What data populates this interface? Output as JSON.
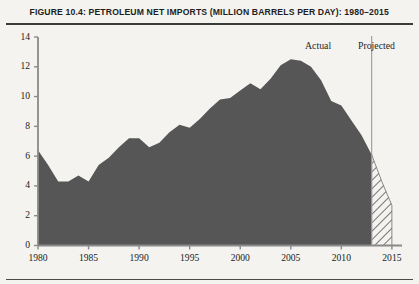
{
  "figure": {
    "title": "FIGURE 10.4: PETROLEUM NET IMPORTS (MILLION BARRELS PER DAY): 1980–2015"
  },
  "annotations": {
    "actual_label": "Actual",
    "projected_label": "Projected",
    "divider_year": 2013
  },
  "axes": {
    "y_ticks": [
      "0",
      "2",
      "4",
      "6",
      "8",
      "10",
      "12",
      "14"
    ],
    "x_ticks": [
      "1980",
      "1985",
      "1990",
      "1995",
      "2000",
      "2005",
      "2010",
      "2015"
    ]
  },
  "colors": {
    "area_fill": "#565656",
    "projected_hatch": "#6a6a6a",
    "axis": "#7d7d7d",
    "background": "#f4f3ef",
    "text": "#1f1f1f"
  },
  "chart_data": {
    "type": "area",
    "title": "FIGURE 10.4: PETROLEUM NET IMPORTS (MILLION BARRELS PER DAY): 1980–2015",
    "xlabel": "",
    "ylabel": "Million barrels per day",
    "xlim": [
      1980,
      2016
    ],
    "ylim": [
      0,
      14
    ],
    "grid": false,
    "legend": false,
    "y_ticks": [
      0,
      2,
      4,
      6,
      8,
      10,
      12,
      14
    ],
    "x_ticks": [
      1980,
      1985,
      1990,
      1995,
      2000,
      2005,
      2010,
      2015
    ],
    "x": [
      1980,
      1981,
      1982,
      1983,
      1984,
      1985,
      1986,
      1987,
      1988,
      1989,
      1990,
      1991,
      1992,
      1993,
      1994,
      1995,
      1996,
      1997,
      1998,
      1999,
      2000,
      2001,
      2002,
      2003,
      2004,
      2005,
      2006,
      2007,
      2008,
      2009,
      2010,
      2011,
      2012,
      2013,
      2014,
      2015
    ],
    "series": [
      {
        "name": "Actual",
        "style": "solid-fill",
        "values": [
          6.4,
          5.4,
          4.3,
          4.3,
          4.7,
          4.3,
          5.4,
          5.9,
          6.6,
          7.2,
          7.2,
          6.6,
          6.9,
          7.6,
          8.1,
          7.9,
          8.5,
          9.2,
          9.8,
          9.9,
          10.4,
          10.9,
          10.5,
          11.2,
          12.1,
          12.5,
          12.4,
          12.0,
          11.1,
          9.7,
          9.4,
          8.4,
          7.4,
          6.1,
          null,
          null
        ]
      },
      {
        "name": "Projected",
        "style": "hatched-fill",
        "values": [
          null,
          null,
          null,
          null,
          null,
          null,
          null,
          null,
          null,
          null,
          null,
          null,
          null,
          null,
          null,
          null,
          null,
          null,
          null,
          null,
          null,
          null,
          null,
          null,
          null,
          null,
          null,
          null,
          null,
          null,
          null,
          null,
          null,
          6.1,
          4.3,
          2.7
        ]
      }
    ]
  }
}
